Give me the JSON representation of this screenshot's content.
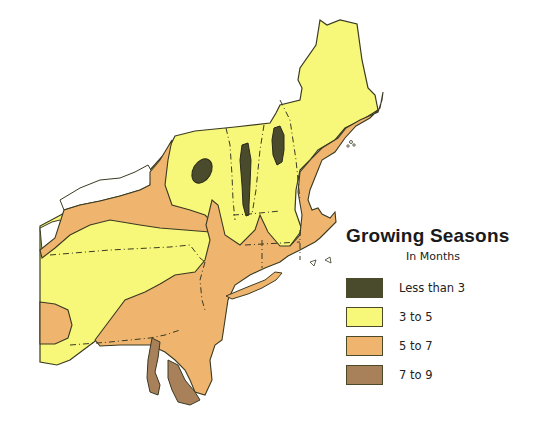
{
  "legend": {
    "title": "Growing Seasons",
    "subtitle": "In Months",
    "items": [
      {
        "label": "Less than 3",
        "color": "#4a4a2c"
      },
      {
        "label": "3 to 5",
        "color": "#f7f77a"
      },
      {
        "label": "5 to 7",
        "color": "#efb56e"
      },
      {
        "label": "7 to 9",
        "color": "#a8805a"
      }
    ]
  },
  "map": {
    "region": "Northeastern United States",
    "colors": {
      "outline": "#3a3a22",
      "lakes": "#ffffff",
      "background": "#ffffff"
    }
  }
}
